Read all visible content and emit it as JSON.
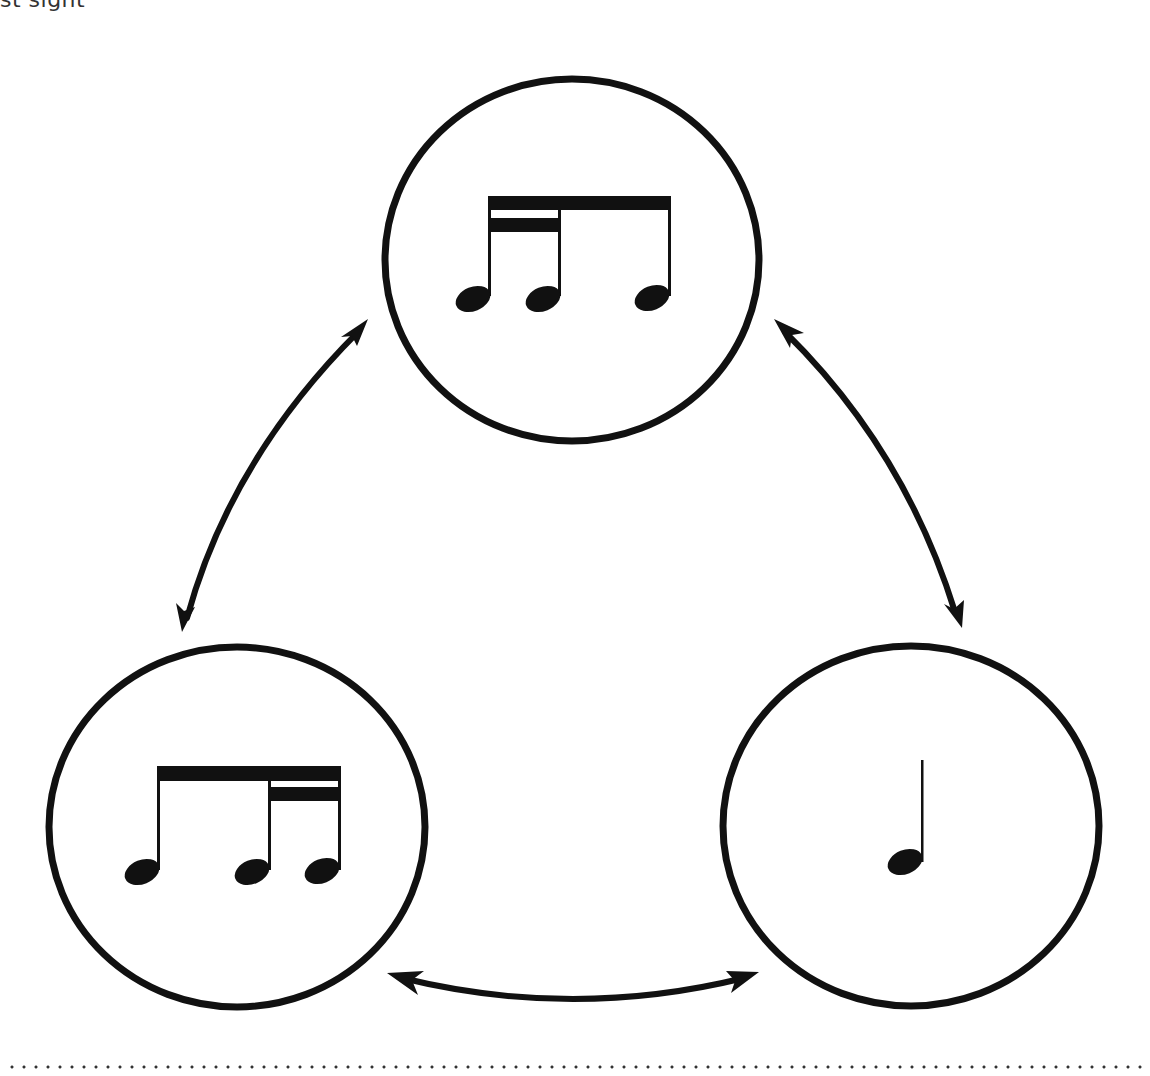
{
  "caption": {
    "text": "st sight"
  },
  "diagram": {
    "stroke_color": "#111111",
    "nodes": [
      {
        "id": "top",
        "label": "sixteenth-sixteenth-eighth",
        "rhythm": [
          "sixteenth",
          "sixteenth",
          "eighth"
        ],
        "center": [
          572,
          260
        ],
        "rx": 188,
        "ry": 182
      },
      {
        "id": "bottom-left",
        "label": "eighth-sixteenth-sixteenth",
        "rhythm": [
          "eighth",
          "sixteenth",
          "sixteenth"
        ],
        "center": [
          237,
          827
        ],
        "rx": 189,
        "ry": 181
      },
      {
        "id": "bottom-right",
        "label": "quarter",
        "rhythm": [
          "quarter"
        ],
        "center": [
          911,
          826
        ],
        "rx": 188,
        "ry": 181
      }
    ],
    "edges": [
      {
        "from": "top",
        "to": "bottom-left",
        "type": "bidirectional-arrow"
      },
      {
        "from": "top",
        "to": "bottom-right",
        "type": "bidirectional-arrow"
      },
      {
        "from": "bottom-left",
        "to": "bottom-right",
        "type": "bidirectional-arrow"
      }
    ]
  },
  "footer": {
    "rule": "dotted"
  }
}
